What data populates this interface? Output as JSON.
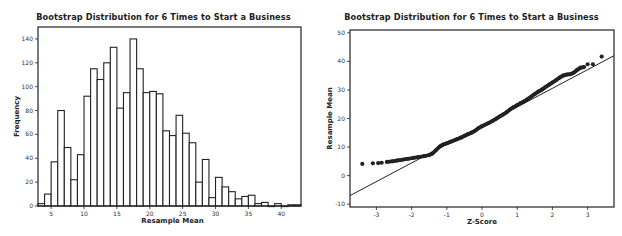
{
  "chart_data": [
    {
      "type": "bar",
      "title": "Bootstrap Distribution for 6 Times to Start a Business",
      "xlabel": "Resample Mean",
      "ylabel": "Frequency",
      "xlim": [
        3,
        43
      ],
      "ylim": [
        0,
        150
      ],
      "xticks": [
        5,
        10,
        15,
        20,
        25,
        30,
        35,
        40
      ],
      "yticks": [
        0,
        20,
        40,
        60,
        80,
        100,
        120,
        140
      ],
      "bin_width": 1,
      "bin_starts": [
        3,
        4,
        5,
        6,
        7,
        8,
        9,
        10,
        11,
        12,
        13,
        14,
        15,
        16,
        17,
        18,
        19,
        20,
        21,
        22,
        23,
        24,
        25,
        26,
        27,
        28,
        29,
        30,
        31,
        32,
        33,
        34,
        35,
        36,
        37,
        38,
        39,
        40,
        41,
        42
      ],
      "values": [
        2,
        10,
        37,
        80,
        49,
        22,
        43,
        92,
        115,
        106,
        120,
        133,
        82,
        95,
        140,
        115,
        95,
        96,
        94,
        63,
        59,
        76,
        61,
        53,
        20,
        39,
        7,
        24,
        16,
        12,
        6,
        8,
        9,
        2,
        3,
        0,
        2,
        0,
        1,
        1
      ],
      "grid": false,
      "bar_fill": "#ffffff",
      "bar_stroke": "#222222"
    },
    {
      "type": "scatter",
      "title": "Bootstrap Distribution for 6 Times to Start a Business",
      "xlabel": "Z-Score",
      "ylabel": "Resample Mean",
      "xlim": [
        -3.75,
        3.75
      ],
      "ylim": [
        -11,
        51
      ],
      "xticks": [
        -3,
        -2,
        -1,
        0,
        1,
        2,
        3
      ],
      "yticks": [
        -10,
        0,
        10,
        20,
        30,
        40,
        50
      ],
      "reference_line": {
        "x": [
          -3.75,
          3.75
        ],
        "y": [
          -7,
          42
        ]
      },
      "points": [
        [
          -3.4,
          4.1
        ],
        [
          -3.1,
          4.3
        ],
        [
          -2.95,
          4.4
        ],
        [
          -2.85,
          4.5
        ],
        [
          -2.7,
          4.8
        ],
        [
          -2.55,
          5.0
        ],
        [
          -2.4,
          5.3
        ],
        [
          -2.25,
          5.6
        ],
        [
          -2.1,
          5.9
        ],
        [
          -1.95,
          6.2
        ],
        [
          -1.8,
          6.5
        ],
        [
          -1.65,
          6.8
        ],
        [
          -1.5,
          7.2
        ],
        [
          -1.4,
          7.8
        ],
        [
          -1.3,
          9.0
        ],
        [
          -1.2,
          10.2
        ],
        [
          -1.1,
          10.9
        ],
        [
          -1.0,
          11.3
        ],
        [
          -0.9,
          11.8
        ],
        [
          -0.8,
          12.3
        ],
        [
          -0.7,
          12.8
        ],
        [
          -0.6,
          13.3
        ],
        [
          -0.5,
          13.9
        ],
        [
          -0.4,
          14.5
        ],
        [
          -0.3,
          15.0
        ],
        [
          -0.2,
          15.7
        ],
        [
          -0.1,
          16.6
        ],
        [
          0.0,
          17.3
        ],
        [
          0.1,
          17.9
        ],
        [
          0.2,
          18.5
        ],
        [
          0.3,
          19.2
        ],
        [
          0.4,
          19.9
        ],
        [
          0.5,
          20.7
        ],
        [
          0.6,
          21.4
        ],
        [
          0.7,
          22.2
        ],
        [
          0.8,
          23.2
        ],
        [
          0.9,
          24.0
        ],
        [
          1.0,
          24.7
        ],
        [
          1.1,
          25.4
        ],
        [
          1.2,
          26.0
        ],
        [
          1.3,
          26.8
        ],
        [
          1.4,
          27.7
        ],
        [
          1.5,
          28.6
        ],
        [
          1.6,
          29.4
        ],
        [
          1.7,
          30.1
        ],
        [
          1.8,
          31.0
        ],
        [
          1.9,
          31.8
        ],
        [
          2.0,
          32.6
        ],
        [
          2.1,
          33.4
        ],
        [
          2.2,
          34.3
        ],
        [
          2.3,
          35.0
        ],
        [
          2.4,
          35.4
        ],
        [
          2.5,
          35.5
        ],
        [
          2.6,
          36.0
        ],
        [
          2.7,
          37.0
        ],
        [
          2.8,
          37.8
        ],
        [
          2.9,
          38.0
        ],
        [
          3.0,
          39.0
        ],
        [
          3.15,
          39.0
        ],
        [
          3.4,
          41.7
        ]
      ],
      "grid": false,
      "marker_color": "#222222",
      "line_color": "#222222"
    }
  ]
}
